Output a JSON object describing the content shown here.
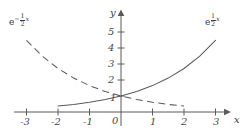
{
  "figure": {
    "type": "line",
    "background": "#ffffff",
    "ink_color": "#4a4a4a"
  },
  "axes": {
    "x_label": "x",
    "y_label": "y",
    "x_ticks": [
      "-3",
      "-2",
      "-1",
      "1",
      "2",
      "3"
    ],
    "y_ticks": [
      "5",
      "4",
      "3",
      "2",
      "1"
    ],
    "origin_label": "0"
  },
  "curves": {
    "solid": {
      "label_base": "e",
      "label_exp_num": "1",
      "label_exp_den": "2",
      "label_exp_var": "x",
      "style": "solid"
    },
    "dashed": {
      "label_base": "e",
      "label_exp_sign": "−",
      "label_exp_num": "1",
      "label_exp_den": "2",
      "label_exp_var": "x",
      "style": "dashed"
    }
  },
  "chart_data": {
    "type": "line",
    "title": "",
    "xlabel": "x",
    "ylabel": "y",
    "xlim": [
      -3.4,
      3.4
    ],
    "ylim": [
      -0.35,
      5.8
    ],
    "grid": false,
    "legend": "inline-curve-labels",
    "xticks": [
      -3,
      -2,
      -1,
      1,
      2,
      3
    ],
    "yticks": [
      1,
      2,
      3,
      4,
      5
    ],
    "series": [
      {
        "name": "e^(1/2 x)",
        "style": "solid",
        "label_position": "top-right",
        "x": [
          -2,
          -1.5,
          -1,
          -0.5,
          0,
          0.5,
          1,
          1.5,
          2,
          2.5,
          3
        ],
        "y": [
          0.37,
          0.47,
          0.61,
          0.78,
          1.0,
          1.28,
          1.65,
          2.12,
          2.72,
          3.49,
          4.48
        ]
      },
      {
        "name": "e^(-1/2 x)",
        "style": "dashed",
        "label_position": "top-left",
        "x": [
          -3,
          -2.5,
          -2,
          -1.5,
          -1,
          -0.5,
          0,
          0.5,
          1,
          1.5,
          2
        ],
        "y": [
          4.48,
          3.49,
          2.72,
          2.12,
          1.65,
          1.28,
          1.0,
          0.78,
          0.61,
          0.47,
          0.37
        ]
      }
    ]
  }
}
